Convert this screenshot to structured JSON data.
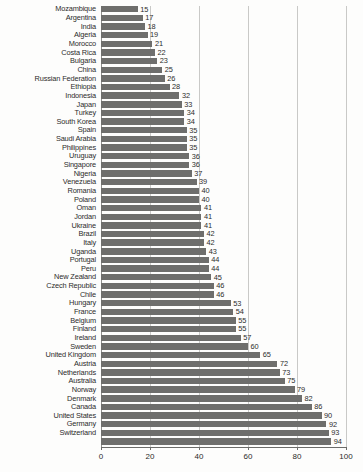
{
  "chart_data": {
    "type": "bar",
    "orientation": "horizontal",
    "title": "",
    "subtitle": "",
    "xlabel": "",
    "ylabel": "",
    "xlim": [
      0,
      100
    ],
    "grid": true,
    "gridlines_at": [
      0,
      20,
      40,
      60,
      80,
      100
    ],
    "legend": null,
    "legend_position": "none",
    "xticks": [
      "0",
      "20",
      "40",
      "60",
      "80",
      "100"
    ],
    "xtick_values": [
      0,
      20,
      40,
      60,
      80,
      100
    ],
    "bar_color": "#6e6e6c",
    "grid_color": "#c9c9c7",
    "axis_color": "#6b6b69",
    "text_color": "#2c2c2b",
    "show_value_labels": true,
    "sort_order": "ascending",
    "categories": [
      "Mozambique",
      "Argentina",
      "India",
      "Algeria",
      "Morocco",
      "Costa Rica",
      "Bulgaria",
      "China",
      "Russian Federation",
      "Ethiopia",
      "Indonesia",
      "Japan",
      "Turkey",
      "South Korea",
      "Spain",
      "Saudi Arabia",
      "Philippines",
      "Uruguay",
      "Singapore",
      "Nigeria",
      "Venezuela",
      "Romania",
      "Poland",
      "Oman",
      "Jordan",
      "Ukraine",
      "Brazil",
      "Italy",
      "Uganda",
      "Portugal",
      "Peru",
      "New Zealand",
      "Czech Republic",
      "Chile",
      "Hungary",
      "France",
      "Belgium",
      "Finland",
      "Ireland",
      "Sweden",
      "United Kingdom",
      "Austria",
      "Netherlands",
      "Australia",
      "Norway",
      "Denmark",
      "Canada",
      "United States",
      "Germany",
      "Switzerland"
    ],
    "values": [
      15,
      17,
      18,
      19,
      21,
      22,
      23,
      25,
      26,
      28,
      32,
      33,
      34,
      34,
      35,
      35,
      35,
      36,
      36,
      37,
      39,
      40,
      40,
      41,
      41,
      41,
      42,
      42,
      43,
      44,
      44,
      45,
      46,
      46,
      53,
      54,
      55,
      55,
      57,
      60,
      65,
      72,
      73,
      75,
      79,
      82,
      86,
      90,
      92,
      93
    ],
    "value_labels": [
      "15",
      "17",
      "18",
      "19",
      "21",
      "22",
      "23",
      "25",
      "26",
      "28",
      "32",
      "33",
      "34",
      "34",
      "35",
      "35",
      "35",
      "36",
      "36",
      "37",
      "39",
      "40",
      "40",
      "41",
      "41",
      "41",
      "42",
      "42",
      "43",
      "44",
      "44",
      "45",
      "46",
      "46",
      "53",
      "54",
      "55",
      "55",
      "57",
      "60",
      "65",
      "72",
      "73",
      "75",
      "79",
      "82",
      "86",
      "90",
      "92",
      "93"
    ],
    "extra_bottom_value": 94,
    "extra_bottom_label": "94"
  }
}
